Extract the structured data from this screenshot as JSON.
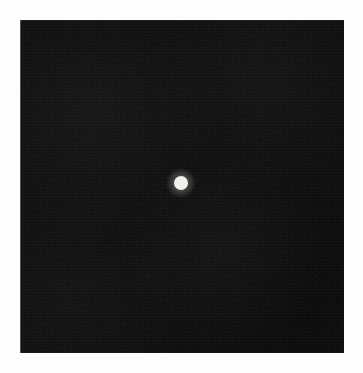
{
  "canvas": {
    "width": 363,
    "height": 373,
    "background_color": "#fdfdfd"
  },
  "field": {
    "label": "dark field",
    "x": 20,
    "y": 20,
    "width": 324,
    "height": 333,
    "fill_color": "#0d0d0d",
    "edge_line_color": "#6a6a6a",
    "texture": "film grain"
  },
  "chart_data": {
    "type": "scatter",
    "title": "",
    "subtitle": "",
    "xlabel": "",
    "ylabel": "",
    "grid": false,
    "legend": null,
    "background_color": "#0d0d0d",
    "plot_area": {
      "x": 20,
      "y": 20,
      "width": 324,
      "height": 333
    },
    "xlim": [
      0,
      324
    ],
    "ylim": [
      0,
      333
    ],
    "xticks": [],
    "yticks": [],
    "series": [
      {
        "name": "point source",
        "color": "#f2f0ec",
        "marker": "circle",
        "marker_diameter_px": 14,
        "points": [
          {
            "x": 161,
            "y": 163,
            "screen_x": 181,
            "screen_y": 183
          }
        ]
      }
    ],
    "annotations": []
  },
  "point_source": {
    "label": "bright point",
    "center_x": 181,
    "center_y": 183,
    "diameter": 14,
    "color": "#f2f0ec",
    "halo_diameter": 30
  }
}
